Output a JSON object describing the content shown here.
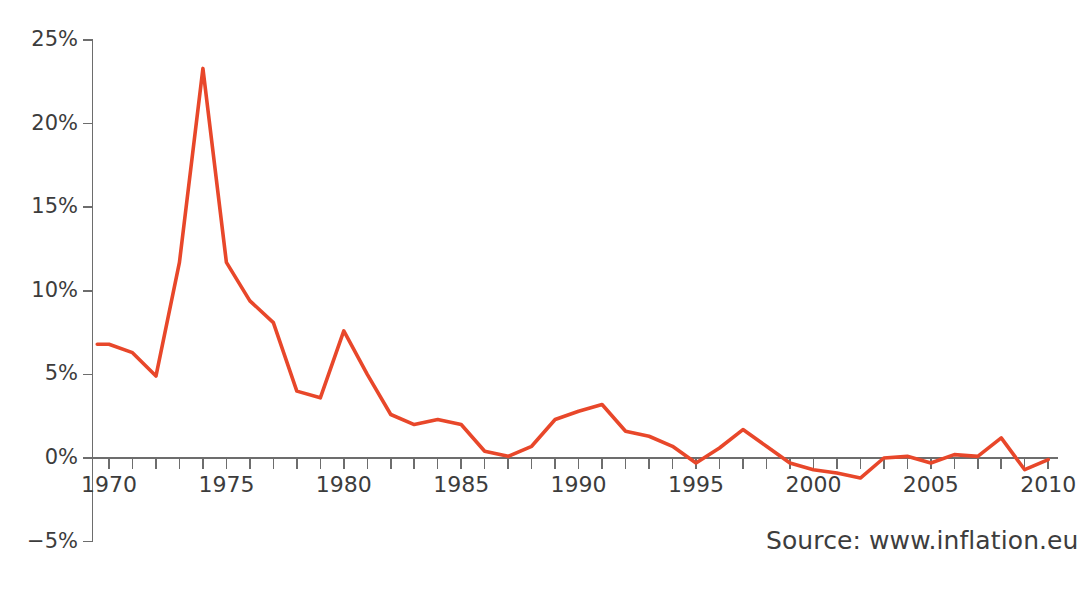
{
  "figure": {
    "cut_off_title": "",
    "source_note": "Source: www.inflation.eu"
  },
  "chart_data": {
    "type": "line",
    "title": "",
    "subtitle": "",
    "xlabel": "",
    "ylabel": "",
    "xlim": [
      1969.3,
      2010.4
    ],
    "ylim": [
      -5,
      25
    ],
    "grid": false,
    "legend": null,
    "legend_position": "none",
    "line_color": "#e8472a",
    "line_width_px": 3.6,
    "y_ticks": [
      25,
      20,
      15,
      10,
      5,
      0,
      -5
    ],
    "y_tick_labels": [
      "25%",
      "20%",
      "15%",
      "10%",
      "5%",
      "0%",
      "-5%"
    ],
    "x_tick_years": [
      1970,
      1971,
      1972,
      1973,
      1974,
      1975,
      1976,
      1977,
      1978,
      1979,
      1980,
      1981,
      1982,
      1983,
      1984,
      1985,
      1986,
      1987,
      1988,
      1989,
      1990,
      1991,
      1992,
      1993,
      1994,
      1995,
      1996,
      1997,
      1998,
      1999,
      2000,
      2001,
      2002,
      2003,
      2004,
      2005,
      2006,
      2007,
      2008,
      2009,
      2010
    ],
    "x_labeled_years": [
      1970,
      1975,
      1980,
      1985,
      1990,
      1995,
      2000,
      2005,
      2010
    ],
    "x_tick_labels": [
      "1970",
      "1975",
      "1980",
      "1985",
      "1990",
      "1995",
      "2000",
      "2005",
      "2010"
    ],
    "x": [
      1969.5,
      1970,
      1971,
      1972,
      1973,
      1974,
      1975,
      1976,
      1977,
      1978,
      1979,
      1980,
      1981,
      1982,
      1983,
      1984,
      1985,
      1986,
      1987,
      1988,
      1989,
      1990,
      1991,
      1992,
      1993,
      1994,
      1995,
      1996,
      1997,
      1998,
      1999,
      2000,
      2001,
      2002,
      2003,
      2004,
      2005,
      2006,
      2007,
      2008,
      2009,
      2010
    ],
    "values": [
      6.8,
      6.8,
      6.3,
      4.9,
      11.7,
      23.3,
      11.7,
      9.4,
      8.1,
      4.0,
      3.6,
      7.6,
      5.0,
      2.6,
      2.0,
      2.3,
      2.0,
      0.4,
      0.1,
      0.7,
      2.3,
      2.8,
      3.2,
      1.6,
      1.3,
      0.7,
      -0.3,
      0.6,
      1.7,
      0.7,
      -0.3,
      -0.7,
      -0.9,
      -1.2,
      0.0,
      0.1,
      -0.3,
      0.2,
      0.1,
      1.2,
      -0.7,
      -0.1
    ],
    "y_unit": "%"
  }
}
